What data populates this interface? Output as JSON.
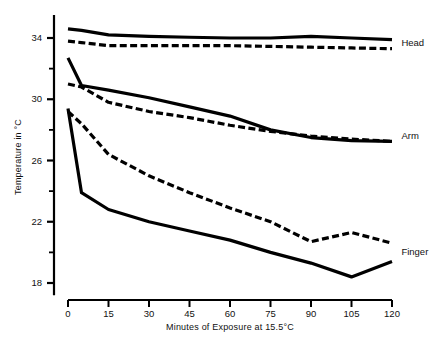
{
  "chart_data": {
    "type": "line",
    "title": "",
    "xlabel": "Minutes of Exposure at 15.5°C",
    "ylabel": "Temperature in °C",
    "xlim": [
      0,
      120
    ],
    "ylim": [
      16,
      35.6
    ],
    "xticks": [
      0,
      15,
      30,
      45,
      60,
      75,
      90,
      105,
      120
    ],
    "xtick_labels": [
      "0",
      "15",
      "30",
      "45",
      "60",
      "75",
      "90",
      "105",
      "120"
    ],
    "yticks": [
      18,
      22,
      26,
      30,
      34
    ],
    "ytick_labels": [
      "18",
      "22",
      "26",
      "30",
      "34"
    ],
    "yminorticks": [
      20,
      24,
      28,
      32
    ],
    "grid": false,
    "legend_position": "right-inline",
    "x": [
      0,
      5,
      15,
      30,
      45,
      60,
      75,
      90,
      105,
      120
    ],
    "series": [
      {
        "name": "Head (solid)",
        "label": "Head",
        "style": "solid",
        "color": "#000000",
        "values": [
          34.6,
          34.5,
          34.2,
          34.1,
          34.05,
          34.0,
          34.0,
          34.1,
          34.0,
          33.9
        ]
      },
      {
        "name": "Head (dashed)",
        "label": "Head",
        "style": "dashed",
        "color": "#000000",
        "values": [
          33.8,
          33.7,
          33.5,
          33.5,
          33.5,
          33.5,
          33.45,
          33.4,
          33.35,
          33.3
        ]
      },
      {
        "name": "Arm (solid)",
        "label": "Arm",
        "style": "solid",
        "color": "#000000",
        "values": [
          32.7,
          30.9,
          30.6,
          30.1,
          29.5,
          28.9,
          28.0,
          27.5,
          27.3,
          27.25
        ]
      },
      {
        "name": "Arm (dashed)",
        "label": "Arm",
        "style": "dashed",
        "color": "#000000",
        "values": [
          31.0,
          30.8,
          29.8,
          29.2,
          28.8,
          28.3,
          27.9,
          27.6,
          27.4,
          27.25
        ]
      },
      {
        "name": "Finger (dashed)",
        "label": "Finger",
        "style": "dashed",
        "color": "#000000",
        "values": [
          29.2,
          28.4,
          26.4,
          25.0,
          23.9,
          22.9,
          22.0,
          20.7,
          21.3,
          20.6
        ]
      },
      {
        "name": "Finger (solid)",
        "label": "Finger",
        "style": "solid",
        "color": "#000000",
        "values": [
          29.4,
          23.9,
          22.8,
          22.0,
          21.4,
          20.8,
          20.0,
          19.3,
          18.4,
          19.4
        ]
      }
    ],
    "series_labels": [
      {
        "text": "Head",
        "x": 122,
        "y": 33.7
      },
      {
        "text": "Arm",
        "x": 122,
        "y": 27.6
      },
      {
        "text": "Finger",
        "x": 122,
        "y": 20.0
      }
    ]
  }
}
